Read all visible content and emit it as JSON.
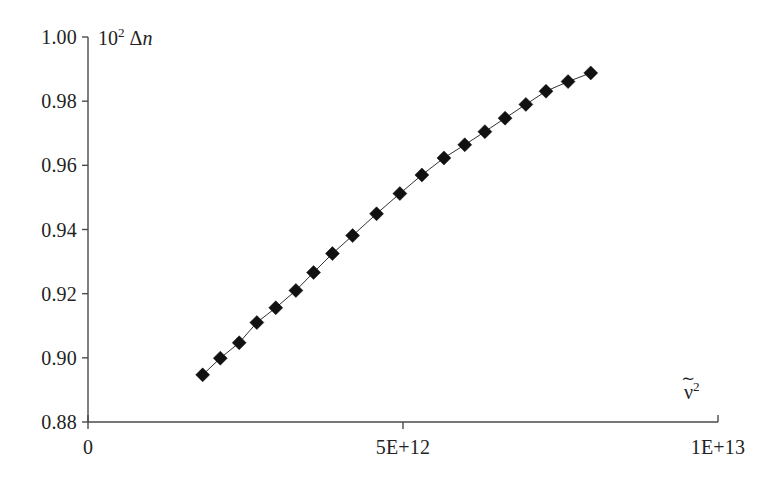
{
  "figure": {
    "background_color": "#ffffff",
    "ink_color": "#1a1a1a",
    "axis_color": "#4a4a4a"
  },
  "axes": {
    "y_axis_title_prefix": "10",
    "y_axis_title_exponent": "2",
    "y_axis_title_symbol": "Δ",
    "y_axis_title_variable": "n",
    "y_axis_title_full": "10² Δn",
    "x_axis_title_variable": "ν",
    "x_axis_title_tilde": "∼",
    "x_axis_title_exponent": "2",
    "x_axis_title_full": "ν̃²",
    "y_tick_labels": [
      "1.00",
      "0.98",
      "0.96",
      "0.94",
      "0.92",
      "0.90",
      "0.88"
    ],
    "x_tick_labels": [
      "0",
      "5E+12",
      "1E+13"
    ]
  },
  "chart_data": {
    "type": "scatter",
    "title": "",
    "xlabel": "ν̃²",
    "ylabel": "10² Δn",
    "xlim": [
      0,
      10000000000000.0
    ],
    "ylim": [
      0.88,
      1.0
    ],
    "xticks": [
      0,
      5000000000000.0,
      10000000000000.0
    ],
    "xticklabels": [
      "0",
      "5E+12",
      "1E+13"
    ],
    "yticks": [
      0.88,
      0.9,
      0.92,
      0.94,
      0.96,
      0.98,
      1.0
    ],
    "yticklabels": [
      "0.88",
      "0.90",
      "0.92",
      "0.94",
      "0.96",
      "0.98",
      "1.00"
    ],
    "grid": false,
    "legend": null,
    "marker": "diamond",
    "marker_color": "#111111",
    "line_color": "#333333",
    "line_width": 1,
    "series": [
      {
        "name": "birefringence vs wavenumber squared",
        "x": [
          1820000000000.0,
          2100000000000.0,
          2400000000000.0,
          2680000000000.0,
          2980000000000.0,
          3300000000000.0,
          3580000000000.0,
          3880000000000.0,
          4200000000000.0,
          4580000000000.0,
          4950000000000.0,
          5300000000000.0,
          5650000000000.0,
          5980000000000.0,
          6300000000000.0,
          6620000000000.0,
          6950000000000.0,
          7270000000000.0,
          7620000000000.0,
          7980000000000.0
        ],
        "y": [
          0.8947,
          0.8999,
          0.9047,
          0.911,
          0.9156,
          0.921,
          0.9266,
          0.9325,
          0.9381,
          0.9449,
          0.9512,
          0.957,
          0.9623,
          0.9664,
          0.9705,
          0.9747,
          0.979,
          0.9831,
          0.9861,
          0.9888
        ]
      }
    ]
  }
}
